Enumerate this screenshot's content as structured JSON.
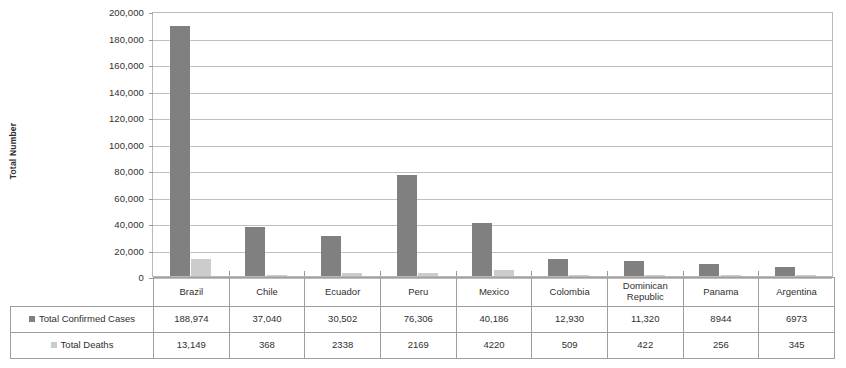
{
  "chart_data": {
    "type": "bar",
    "title": "",
    "xlabel": "",
    "ylabel": "Total Number",
    "ylim": [
      0,
      200000
    ],
    "ytick_step": 20000,
    "grid": true,
    "legend_position": "table-row-labels",
    "categories": [
      "Brazil",
      "Chile",
      "Ecuador",
      "Peru",
      "Mexico",
      "Colombia",
      "Dominican Republic",
      "Panama",
      "Argentina"
    ],
    "series": [
      {
        "name": "Total Confirmed Cases",
        "color": "#808080",
        "values": [
          188974,
          37040,
          30502,
          76306,
          40186,
          12930,
          11320,
          8944,
          6973
        ],
        "labels": [
          "188,974",
          "37,040",
          "30,502",
          "76,306",
          "40,186",
          "12,930",
          "11,320",
          "8944",
          "6973"
        ]
      },
      {
        "name": "Total Deaths",
        "color": "#cccccc",
        "values": [
          13149,
          368,
          2338,
          2169,
          4220,
          509,
          422,
          256,
          345
        ],
        "labels": [
          "13,149",
          "368",
          "2338",
          "2169",
          "4220",
          "509",
          "422",
          "256",
          "345"
        ]
      }
    ],
    "ytick_labels": [
      "200,000",
      "180,000",
      "160,000",
      "140,000",
      "120,000",
      "100,000",
      "80,000",
      "60,000",
      "40,000",
      "20,000",
      "0"
    ],
    "ytick_values": [
      200000,
      180000,
      160000,
      140000,
      120000,
      100000,
      80000,
      60000,
      40000,
      20000,
      0
    ]
  }
}
